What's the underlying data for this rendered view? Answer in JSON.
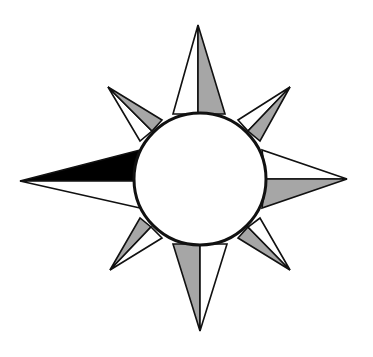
{
  "diagram": {
    "center": [
      200,
      179
    ],
    "circle_radius": 66,
    "colors": {
      "stroke": "#111111",
      "gray": "#a6a6a6",
      "black": "#000000",
      "white": "#ffffff"
    },
    "points": [
      {
        "name": "north",
        "tip": [
          198,
          25
        ],
        "baseA": [
          173,
          114
        ],
        "baseB": [
          225,
          114
        ],
        "mid": [
          198,
          114
        ],
        "fillA": "#ffffff",
        "fillB": "#a6a6a6"
      },
      {
        "name": "south",
        "tip": [
          200,
          331
        ],
        "baseA": [
          173,
          244
        ],
        "baseB": [
          227,
          244
        ],
        "mid": [
          200,
          244
        ],
        "fillA": "#a6a6a6",
        "fillB": "#ffffff"
      },
      {
        "name": "west",
        "tip": [
          20,
          181
        ],
        "baseA": [
          140,
          150
        ],
        "baseB": [
          140,
          208
        ],
        "mid": [
          136,
          181
        ],
        "fillA": "#000000",
        "fillB": "#ffffff"
      },
      {
        "name": "east",
        "tip": [
          347,
          179
        ],
        "baseA": [
          262,
          150
        ],
        "baseB": [
          262,
          208
        ],
        "mid": [
          266,
          179
        ],
        "fillA": "#ffffff",
        "fillB": "#a6a6a6"
      },
      {
        "name": "northwest",
        "tip": [
          108,
          87
        ],
        "baseA": [
          140,
          141
        ],
        "baseB": [
          162,
          120
        ],
        "mid": [
          152,
          131
        ],
        "fillA": "#ffffff",
        "fillB": "#a6a6a6"
      },
      {
        "name": "northeast",
        "tip": [
          290,
          87
        ],
        "baseA": [
          238,
          120
        ],
        "baseB": [
          260,
          141
        ],
        "mid": [
          248,
          131
        ],
        "fillA": "#ffffff",
        "fillB": "#a6a6a6"
      },
      {
        "name": "southwest",
        "tip": [
          110,
          270
        ],
        "baseA": [
          140,
          218
        ],
        "baseB": [
          162,
          238
        ],
        "mid": [
          151,
          227
        ],
        "fillA": "#a6a6a6",
        "fillB": "#ffffff"
      },
      {
        "name": "southeast",
        "tip": [
          290,
          270
        ],
        "baseA": [
          238,
          238
        ],
        "baseB": [
          260,
          218
        ],
        "mid": [
          248,
          227
        ],
        "fillA": "#a6a6a6",
        "fillB": "#ffffff"
      }
    ],
    "caption": ""
  }
}
